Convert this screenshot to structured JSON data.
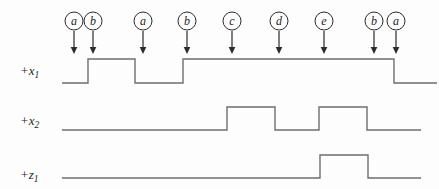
{
  "diagram": {
    "background_color": "#fdfdfd",
    "waveform_color": "#6e6e6e",
    "marker_color": "#2b2b2b",
    "text_color": "#1f1f1f",
    "event_circle": {
      "cy": 21,
      "r": 9,
      "letter_baseline_y": 25,
      "arrow_start_y": 31,
      "arrow_line_end_y": 47,
      "arrow_tip_y": 54,
      "arrow_half_width": 3.3
    },
    "events": [
      {
        "label": "a",
        "x": 74
      },
      {
        "label": "b",
        "x": 93
      },
      {
        "label": "a",
        "x": 143
      },
      {
        "label": "b",
        "x": 187
      },
      {
        "label": "c",
        "x": 232
      },
      {
        "label": "d",
        "x": 279
      },
      {
        "label": "e",
        "x": 324
      },
      {
        "label": "b",
        "x": 374
      },
      {
        "label": "a",
        "x": 396
      }
    ],
    "signals": [
      {
        "id": "x1",
        "base": "+x",
        "sub": "1",
        "label_x": 20,
        "label_baseline_y": 75,
        "high_y": 59,
        "low_y": 83,
        "x_start": 62,
        "x_end": 437,
        "initial_level": "low",
        "edge_xs": [
          88,
          135,
          183,
          394
        ]
      },
      {
        "id": "x2",
        "base": "+x",
        "sub": "2",
        "label_x": 20,
        "label_baseline_y": 125,
        "high_y": 107,
        "low_y": 130,
        "x_start": 62,
        "x_end": 421,
        "initial_level": "low",
        "edge_xs": [
          227,
          275,
          319,
          367
        ]
      },
      {
        "id": "z1",
        "base": "+z",
        "sub": "1",
        "label_x": 20,
        "label_baseline_y": 179,
        "high_y": 155,
        "low_y": 178,
        "x_start": 62,
        "x_end": 421,
        "initial_level": "low",
        "edge_xs": [
          320,
          368
        ]
      }
    ]
  }
}
